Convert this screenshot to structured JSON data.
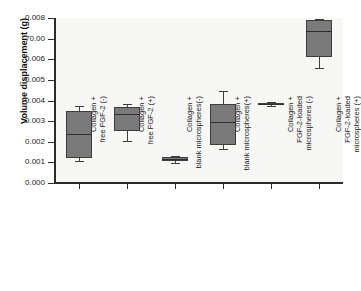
{
  "chart_data": {
    "type": "box",
    "title": "",
    "xlabel": "",
    "ylabel": "Volume displacement (g)",
    "ylim": [
      0.0,
      0.008
    ],
    "grid": false,
    "legend": "none",
    "y_ticks": [
      "0.000",
      "0.001",
      "0.002",
      "0.003",
      "0.004",
      "0.005",
      "0.006",
      "70.00",
      "0.008"
    ],
    "y_tick_values": [
      0.0,
      0.001,
      0.002,
      0.003,
      0.004,
      0.005,
      0.006,
      0.007,
      0.008
    ],
    "categories": [
      "Collagen + free FGF-2 (-)",
      "Collagen + free FGF-2 (+)",
      "Collagen + blank microspheres(-)",
      "Collagen + blank microspheres(+)",
      "Collagen + FGF-2-loaded microspheres (-)",
      "Collagen + FGF-2-loaded microspheres (+)"
    ],
    "category_lines": [
      [
        "Collagen +",
        "free FGF-2 (-)"
      ],
      [
        "Collagen +",
        "free FGF-2 (+)"
      ],
      [
        "Collagen +",
        "blank microspheres(-)"
      ],
      [
        "Collagen +",
        "blank microspheres(+)"
      ],
      [
        "Collagen +",
        "FGF-2-loaded",
        "microspheres (-)"
      ],
      [
        "Collagen +",
        "FGF-2-loaded",
        "microspheres (+)"
      ]
    ],
    "boxes": [
      {
        "category": "Collagen + free FGF-2 (-)",
        "whisker_low": 0.00105,
        "q1": 0.0012,
        "median": 0.00237,
        "q3": 0.0035,
        "whisker_high": 0.00375
      },
      {
        "category": "Collagen + free FGF-2 (+)",
        "whisker_low": 0.00205,
        "q1": 0.0025,
        "median": 0.00335,
        "q3": 0.0037,
        "whisker_high": 0.00385
      },
      {
        "category": "Collagen + blank microspheres(-)",
        "whisker_low": 0.00098,
        "q1": 0.00105,
        "median": 0.00118,
        "q3": 0.00128,
        "whisker_high": 0.00133
      },
      {
        "category": "Collagen + blank microspheres(+)",
        "whisker_low": 0.00163,
        "q1": 0.00185,
        "median": 0.00295,
        "q3": 0.00385,
        "whisker_high": 0.00448
      },
      {
        "category": "Collagen + FGF-2-loaded microspheres (-)",
        "whisker_low": 0.00375,
        "q1": 0.00378,
        "median": 0.00383,
        "q3": 0.0039,
        "whisker_high": 0.00392
      },
      {
        "category": "Collagen + FGF-2-loaded microspheres (+)",
        "whisker_low": 0.00557,
        "q1": 0.00613,
        "median": 0.00737,
        "q3": 0.00788,
        "whisker_high": 0.00797
      }
    ],
    "colors": {
      "box_fill": "#7a7a7a",
      "box_edge": "#3d3d3d",
      "median": "#2e2e2e",
      "axis": "#2b2b2b",
      "plot_background": "#f7f7f5",
      "figure_background": "#ffffff"
    }
  }
}
